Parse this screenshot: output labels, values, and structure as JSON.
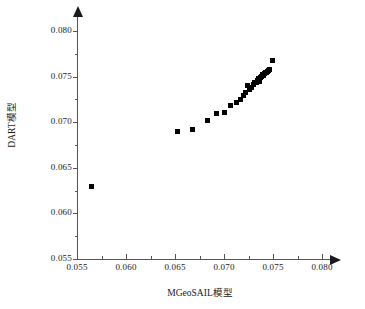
{
  "chart_data": {
    "type": "scatter",
    "title": "",
    "xlabel": "MGeoSAIL模型",
    "ylabel": "DART模型",
    "xlim": [
      0.055,
      0.08
    ],
    "ylim": [
      0.055,
      0.08
    ],
    "xticks": [
      0.055,
      0.06,
      0.065,
      0.07,
      0.075,
      0.08
    ],
    "yticks": [
      0.055,
      0.06,
      0.065,
      0.07,
      0.075,
      0.08
    ],
    "xtick_labels": [
      "0.055",
      "0.060",
      "0.065",
      "0.070",
      "0.075",
      "0.080"
    ],
    "ytick_labels": [
      "0.055",
      "0.060",
      "0.065",
      "0.070",
      "0.075",
      "0.080"
    ],
    "minor_ticks": true,
    "grid": false,
    "legend": null,
    "marker": "square",
    "marker_color": "#000000",
    "marker_size_px": 5,
    "series": [
      {
        "name": "DART vs MGeoSAIL",
        "points": [
          [
            0.0565,
            0.063
          ],
          [
            0.0653,
            0.069
          ],
          [
            0.0668,
            0.0692
          ],
          [
            0.0683,
            0.0702
          ],
          [
            0.0692,
            0.071
          ],
          [
            0.07,
            0.0711
          ],
          [
            0.0707,
            0.0718
          ],
          [
            0.0713,
            0.0722
          ],
          [
            0.0717,
            0.0725
          ],
          [
            0.072,
            0.0729
          ],
          [
            0.0722,
            0.0733
          ],
          [
            0.0724,
            0.074
          ],
          [
            0.0726,
            0.0736
          ],
          [
            0.0728,
            0.0738
          ],
          [
            0.073,
            0.0741
          ],
          [
            0.0731,
            0.0744
          ],
          [
            0.0733,
            0.0743
          ],
          [
            0.0734,
            0.0746
          ],
          [
            0.0735,
            0.0748
          ],
          [
            0.0736,
            0.0745
          ],
          [
            0.0737,
            0.0749
          ],
          [
            0.0738,
            0.075
          ],
          [
            0.0739,
            0.0752
          ],
          [
            0.074,
            0.0751
          ],
          [
            0.0741,
            0.0753
          ],
          [
            0.0742,
            0.0754
          ],
          [
            0.0743,
            0.0755
          ],
          [
            0.0744,
            0.0756
          ],
          [
            0.0745,
            0.0757
          ],
          [
            0.0746,
            0.0758
          ],
          [
            0.0749,
            0.0768
          ]
        ]
      }
    ]
  }
}
